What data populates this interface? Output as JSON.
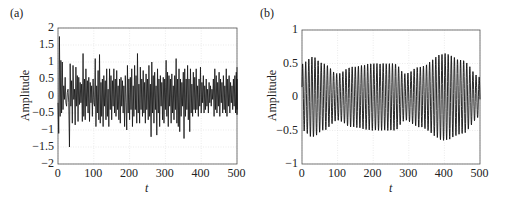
{
  "chart_data": [
    {
      "panel": "(a)",
      "type": "line",
      "title": "",
      "xlabel": "t",
      "ylabel": "Amplitude",
      "xlim": [
        0,
        500
      ],
      "ylim": [
        -2,
        2
      ],
      "xticks": [
        "0",
        "100",
        "200",
        "300",
        "400",
        "500"
      ],
      "yticks": [
        "2",
        "1.5",
        "1",
        "0.5",
        "0",
        "-0.5",
        "-1",
        "-1.5",
        "-2"
      ],
      "grid": true,
      "series": [
        {
          "name": "signal",
          "x_step": 2,
          "values": [
            -0.2,
            -1.1,
            1.75,
            -0.6,
            1.05,
            -0.5,
            1.0,
            -0.4,
            0.3,
            -0.1,
            0.55,
            -0.2,
            -0.3,
            0.1,
            0.2,
            -0.2,
            -1.5,
            0.95,
            -0.3,
            0.45,
            -0.8,
            0.9,
            -0.1,
            0.2,
            -0.85,
            0.85,
            -0.3,
            0.6,
            -0.75,
            0.55,
            -0.25,
            0.4,
            -0.2,
            0.35,
            -0.75,
            1.25,
            -0.6,
            0.5,
            -0.7,
            0.8,
            -0.3,
            0.45,
            -0.5,
            0.55,
            -0.75,
            0.4,
            -0.2,
            0.3,
            -0.6,
            0.5,
            -0.2,
            -0.3,
            1.1,
            -0.9,
            0.3,
            -0.5,
            0.75,
            -0.7,
            1.22,
            -0.8,
            0.4,
            -0.6,
            0.5,
            -0.9,
            0.6,
            -0.3,
            0.45,
            -0.7,
            0.8,
            -0.6,
            0.2,
            -0.9,
            0.8,
            -0.4,
            0.6,
            -0.7,
            0.45,
            -0.3,
            0.8,
            -0.5,
            0.5,
            -0.6,
            0.75,
            -0.4,
            0.3,
            -0.7,
            0.5,
            -0.8,
            0.55,
            -0.3,
            0.45,
            -0.5,
            0.3,
            -0.9,
            0.6,
            -0.2,
            -1.0,
            0.9,
            -0.5,
            0.5,
            -0.7,
            0.55,
            -0.4,
            0.8,
            -0.9,
            0.3,
            -0.6,
            0.9,
            -0.4,
            0.6,
            -0.8,
            1.25,
            -0.5,
            0.35,
            -0.8,
            0.85,
            -0.4,
            0.5,
            -0.6,
            0.75,
            -0.5,
            0.4,
            -0.8,
            0.65,
            -0.4,
            0.5,
            -0.7,
            0.9,
            -0.6,
            0.35,
            -1.2,
            1.0,
            -0.5,
            0.6,
            -0.8,
            0.7,
            -0.4,
            0.3,
            -1.15,
            0.8,
            -0.5,
            0.5,
            -0.9,
            0.6,
            -0.3,
            0.4,
            -0.7,
            0.55,
            -0.8,
            0.5,
            -0.4,
            1.05,
            -0.6,
            0.7,
            -0.9,
            0.6,
            -0.3,
            0.5,
            -0.8,
            0.65,
            -0.5,
            0.3,
            -0.7,
            0.6,
            -0.4,
            1.1,
            -0.8,
            0.5,
            -0.9,
            0.8,
            -1.05,
            0.5,
            -0.6,
            0.4,
            -0.3,
            0.7,
            -1.25,
            0.8,
            -0.6,
            0.5,
            -0.4,
            0.9,
            -0.7,
            0.5,
            -1.05,
            0.8,
            -0.5,
            0.35,
            -0.6,
            0.7,
            -0.4,
            0.55,
            -0.5,
            0.8,
            -0.4,
            0.3,
            -0.6,
            0.5,
            -0.3,
            0.85,
            -0.5,
            0.4,
            -0.2,
            0.6,
            -0.5,
            0.3,
            -0.4,
            0.5,
            -0.3,
            0.2,
            -0.5,
            0.4,
            -0.2,
            0.3,
            -0.3,
            0.2,
            -0.1,
            0.5,
            -0.6,
            0.8,
            -0.4,
            0.6,
            -0.5,
            0.4,
            -0.3,
            0.7,
            -0.6,
            0.5,
            -0.2,
            0.4,
            -0.5,
            0.6,
            -0.4,
            0.3,
            -0.5,
            0.8,
            -0.6,
            0.5,
            -0.3,
            0.6,
            -0.5,
            0.4,
            -0.2,
            0.3,
            -0.4,
            0.5,
            -0.3,
            0.6,
            -0.5,
            0.7,
            -0.4,
            0.5,
            -0.55,
            0.85
          ]
        }
      ]
    },
    {
      "panel": "(b)",
      "type": "line",
      "title": "",
      "xlabel": "t",
      "ylabel": "Amplitude",
      "xlim": [
        0,
        500
      ],
      "ylim": [
        -1,
        1
      ],
      "xticks": [
        "0",
        "100",
        "200",
        "300",
        "400",
        "500"
      ],
      "yticks": [
        "1",
        "0.5",
        "0",
        "-0.5",
        "-1"
      ],
      "grid": true,
      "series": [
        {
          "name": "signal",
          "description": "quasi-periodic oscillation, period ~8.7, envelope peaks ~0.6 at t~30, ~0.35 at t~100, ~0.5 at t~200-260, ~0.35 at t~290, ~0.65 at t~400, ~0.3 at t~500",
          "period": 8.7,
          "envelope_t": [
            0,
            30,
            60,
            100,
            140,
            200,
            260,
            290,
            330,
            400,
            450,
            500
          ],
          "envelope_a": [
            0.5,
            0.6,
            0.5,
            0.35,
            0.45,
            0.5,
            0.5,
            0.35,
            0.45,
            0.65,
            0.55,
            0.3
          ]
        }
      ]
    }
  ]
}
